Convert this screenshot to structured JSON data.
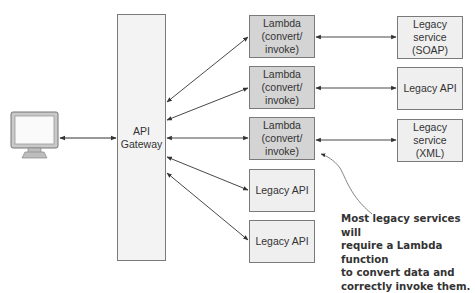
{
  "client": {
    "icon": "monitor-icon"
  },
  "gateway": {
    "label": "API\nGateway"
  },
  "middle_column": [
    {
      "type": "lambda",
      "label": "Lambda\n(convert/\ninvoke)"
    },
    {
      "type": "lambda",
      "label": "Lambda\n(convert/\ninvoke)"
    },
    {
      "type": "lambda",
      "label": "Lambda\n(convert/\ninvoke)"
    },
    {
      "type": "legacy",
      "label": "Legacy API"
    },
    {
      "type": "legacy",
      "label": "Legacy API"
    }
  ],
  "right_column": [
    {
      "label": "Legacy\nservice\n(SOAP)"
    },
    {
      "label": "Legacy API"
    },
    {
      "label": "Legacy\nservice\n(XML)"
    }
  ],
  "annotation": {
    "text": "Most legacy services will\nrequire a Lambda function\nto convert data and\ncorrectly invoke them."
  },
  "colors": {
    "lambda_fill": "#d4d4d4",
    "legacy_fill": "#efefef",
    "gateway_fill": "#f3f3f3",
    "stroke": "#7a7a7a",
    "arrow": "#333333"
  }
}
